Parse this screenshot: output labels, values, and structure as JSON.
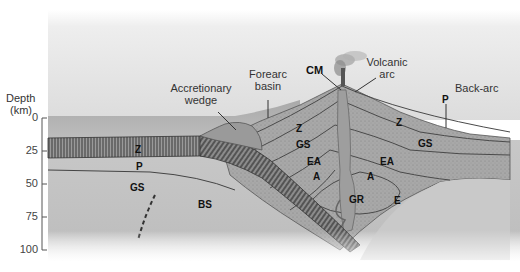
{
  "axis": {
    "title_line1": "Depth",
    "title_line2": "(km)",
    "ticks": [
      "0",
      "25",
      "50",
      "75",
      "100"
    ]
  },
  "callouts": {
    "accretionary_wedge_line1": "Accretionary",
    "accretionary_wedge_line2": "wedge",
    "forearc_basin_line1": "Forearc",
    "forearc_basin_line2": "basin",
    "cm": "CM",
    "volcanic_arc_line1": "Volcanic",
    "volcanic_arc_line2": "arc",
    "back_arc": "Back-arc",
    "p_backarc": "P"
  },
  "zones": {
    "z_slab": "Z",
    "p_slab": "P",
    "gs_slab": "GS",
    "bs": "BS",
    "z_forearc": "Z",
    "gs_forearc": "GS",
    "ea_left": "EA",
    "a_left": "A",
    "gr": "GR",
    "ea_right": "EA",
    "a_right": "A",
    "e": "E",
    "z_backarc": "Z",
    "gs_backarc": "GS"
  }
}
